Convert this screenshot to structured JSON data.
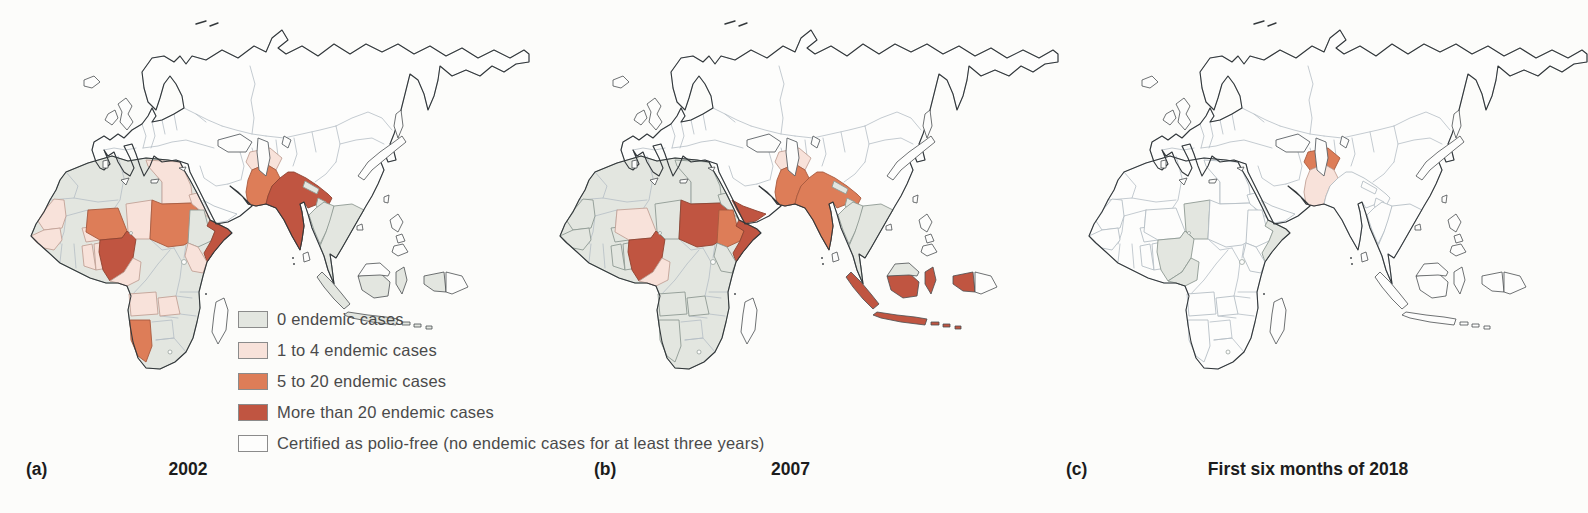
{
  "figure": {
    "type": "choropleth-map-series",
    "topic": "Polio endemic cases by country",
    "panels": [
      {
        "id": "a",
        "label": "(a)",
        "caption": "2002"
      },
      {
        "id": "b",
        "label": "(b)",
        "caption": "2007"
      },
      {
        "id": "c",
        "label": "(c)",
        "caption": "First six months of 2018"
      }
    ]
  },
  "legend": {
    "items": [
      {
        "key": "cases0",
        "label": "0 endemic cases",
        "fill": "#e3e6e0",
        "stroke": "#8e9a93"
      },
      {
        "key": "cases1to4",
        "label": "1 to 4 endemic cases",
        "fill": "#f8e2da",
        "stroke": "#c2a196"
      },
      {
        "key": "cases5to20",
        "label": "5 to 20 endemic cases",
        "fill": "#dd7d58",
        "stroke": "#a85a3e"
      },
      {
        "key": "casesOver20",
        "label": "More than 20 endemic cases",
        "fill": "#c05541",
        "stroke": "#8f4331"
      },
      {
        "key": "free",
        "label": "Certified as polio-free (no endemic cases for at least three years)",
        "fill": "#fdfdfc",
        "stroke": "#b5bec5"
      }
    ]
  },
  "maps": {
    "a": {
      "caption": "2002",
      "default_category": "free",
      "africa_border_color": "#8e9a93",
      "regions": {
        "africa-base": "cases0",
        "eurasia-base": "free",
        "mauritania": "cases1to4",
        "senegal-guinea": "cases1to4",
        "burkina-faso": "cases1to4",
        "ghana": "cases1to4",
        "togo-benin": "cases1to4",
        "niger": "cases5to20",
        "nigeria": "casesOver20",
        "chad": "cases1to4",
        "cameroon": "cases1to4",
        "egypt": "cases1to4",
        "sudan": "cases5to20",
        "eritrea": "cases1to4",
        "ethiopia": "cases0",
        "somalia": "casesOver20",
        "kenya": "cases1to4",
        "angola": "cases1to4",
        "zambia": "cases1to4",
        "namibia": "cases5to20",
        "madagascar": "free",
        "yemen": "free",
        "afghanistan": "cases1to4",
        "pakistan": "cases5to20",
        "india": "casesOver20",
        "nepal": "cases0",
        "bangladesh": "cases0",
        "sri-lanka": "free",
        "myanmar": "cases0",
        "indochina": "cases0",
        "sumatra": "cases0",
        "java": "cases0",
        "borneo-south": "cases0",
        "borneo-north": "free",
        "sulawesi": "cases0",
        "west-papua": "cases0",
        "png": "free",
        "lesser-sunda": "cases0",
        "philippines": "free",
        "japan": "free"
      }
    },
    "b": {
      "caption": "2007",
      "default_category": "free",
      "africa_border_color": "#8e9a93",
      "regions": {
        "africa-base": "cases0",
        "eurasia-base": "free",
        "mauritania": "cases0",
        "senegal-guinea": "cases0",
        "burkina-faso": "cases0",
        "ghana": "cases0",
        "togo-benin": "cases0",
        "niger": "cases1to4",
        "nigeria": "casesOver20",
        "chad": "cases0",
        "cameroon": "cases1to4",
        "egypt": "cases0",
        "sudan": "casesOver20",
        "eritrea": "cases0",
        "ethiopia": "cases5to20",
        "somalia": "casesOver20",
        "kenya": "cases0",
        "angola": "cases0",
        "zambia": "cases0",
        "namibia": "cases0",
        "madagascar": "free",
        "yemen": "casesOver20",
        "afghanistan": "cases1to4",
        "pakistan": "cases5to20",
        "india": "cases5to20",
        "nepal": "cases0",
        "bangladesh": "cases0",
        "sri-lanka": "free",
        "myanmar": "cases0",
        "indochina": "cases0",
        "sumatra": "casesOver20",
        "java": "casesOver20",
        "borneo-south": "casesOver20",
        "borneo-north": "cases0",
        "sulawesi": "casesOver20",
        "west-papua": "casesOver20",
        "png": "free",
        "lesser-sunda": "casesOver20",
        "philippines": "free",
        "japan": "free"
      }
    },
    "c": {
      "caption": "First six months of 2018",
      "default_category": "free",
      "africa_border_color": "#b5bec5",
      "regions": {
        "africa-base": "free",
        "eurasia-base": "free",
        "nigeria": "cases0",
        "chad": "cases0",
        "cameroon": "cases0",
        "somalia": "cases0",
        "afghanistan": "cases5to20",
        "pakistan": "cases1to4",
        "india": "free",
        "sudan": "free",
        "ethiopia": "free",
        "kenya": "free",
        "egypt": "free",
        "niger": "free",
        "mauritania": "free",
        "senegal-guinea": "free",
        "burkina-faso": "free",
        "ghana": "free",
        "togo-benin": "free",
        "eritrea": "free",
        "angola": "free",
        "zambia": "free",
        "namibia": "free",
        "madagascar": "free",
        "yemen": "free",
        "nepal": "free",
        "bangladesh": "free",
        "sri-lanka": "free",
        "myanmar": "free",
        "indochina": "free",
        "sumatra": "free",
        "java": "free",
        "borneo-south": "free",
        "borneo-north": "free",
        "sulawesi": "free",
        "west-papua": "free",
        "png": "free",
        "lesser-sunda": "free",
        "philippines": "free",
        "japan": "free"
      }
    }
  }
}
